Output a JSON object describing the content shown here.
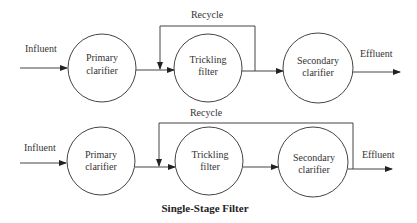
{
  "diagrams": [
    {
      "influent": "Influent",
      "primary": [
        "Primary",
        "clarifier"
      ],
      "trickling": [
        "Trickling",
        "filter"
      ],
      "secondary": [
        "Secondary",
        "clarifier"
      ],
      "recycle": "Recycle",
      "effluent": "Effluent"
    },
    {
      "influent": "Influent",
      "primary": [
        "Primary",
        "clarifier"
      ],
      "trickling": [
        "Trickling",
        "filter"
      ],
      "secondary": [
        "Secondary",
        "clarifier"
      ],
      "recycle": "Recycle",
      "effluent": "Effluent"
    }
  ],
  "caption": "Single-Stage Filter",
  "colors": {
    "line": "#444444",
    "text": "#333333"
  }
}
